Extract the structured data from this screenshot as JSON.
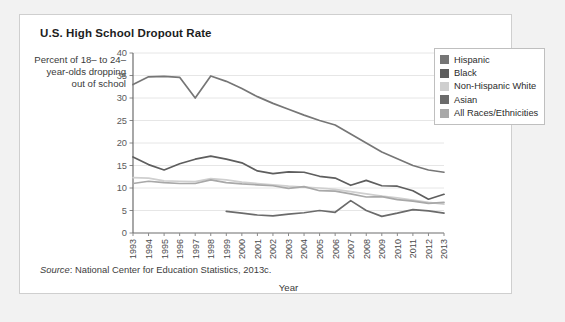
{
  "card": {
    "title": "U.S. High School Dropout Rate",
    "source_word": "Source",
    "source_rest": ": National Center for Education Statistics, 2013c."
  },
  "legend": {
    "position": "top-right",
    "items": [
      {
        "label": "Hispanic",
        "color": "#767676"
      },
      {
        "label": "Black",
        "color": "#5e5e5e"
      },
      {
        "label": "Non-Hispanic White",
        "color": "#cfcfcf"
      },
      {
        "label": "Asian",
        "color": "#6b6b6b"
      },
      {
        "label": "All Races/Ethnicities",
        "color": "#a8a8a8"
      }
    ]
  },
  "chart_data": {
    "type": "line",
    "title": "U.S. High School Dropout Rate",
    "xlabel": "Year",
    "ylabel": "Percent of 18– to 24–year-olds dropping out of school",
    "grid": true,
    "xlim": [
      1993,
      2013
    ],
    "ylim": [
      0,
      40
    ],
    "yticks": [
      0,
      5,
      10,
      15,
      20,
      25,
      30,
      35,
      40
    ],
    "ytick_labels": [
      "0",
      "5",
      "10",
      "15",
      "20",
      "25",
      "30",
      "35",
      "40"
    ],
    "x": [
      1993,
      1994,
      1995,
      1996,
      1997,
      1998,
      1999,
      2000,
      2001,
      2002,
      2003,
      2004,
      2005,
      2006,
      2007,
      2008,
      2009,
      2010,
      2011,
      2012,
      2013
    ],
    "categories": [
      "1993",
      "1994",
      "1995",
      "1996",
      "1997",
      "1998",
      "1999",
      "2000",
      "2001",
      "2002",
      "2003",
      "2004",
      "2005",
      "2006",
      "2007",
      "2008",
      "2009",
      "2010",
      "2011",
      "2012",
      "2013"
    ],
    "series": [
      {
        "name": "Hispanic",
        "color": "#767676",
        "values": [
          33.0,
          34.7,
          34.8,
          34.6,
          30.0,
          34.9,
          33.7,
          32.1,
          30.3,
          28.8,
          27.5,
          26.2,
          25.0,
          24.0,
          22.0,
          20.0,
          18.0,
          16.5,
          15.0,
          14.0,
          13.5
        ]
      },
      {
        "name": "Black",
        "color": "#5e5e5e",
        "values": [
          16.9,
          15.2,
          14.0,
          15.4,
          16.4,
          17.1,
          16.4,
          15.6,
          13.8,
          13.2,
          13.6,
          13.5,
          12.6,
          12.2,
          10.6,
          11.7,
          10.5,
          10.4,
          9.4,
          7.5,
          8.6
        ]
      },
      {
        "name": "Non-Hispanic White",
        "color": "#cfcfcf",
        "values": [
          12.3,
          12.2,
          11.6,
          11.5,
          11.4,
          12.1,
          11.8,
          11.3,
          11.0,
          10.7,
          10.4,
          10.2,
          10.0,
          9.7,
          9.2,
          8.7,
          8.2,
          7.8,
          7.3,
          6.8,
          6.4
        ]
      },
      {
        "name": "Asian",
        "color": "#6b6b6b",
        "values": [
          null,
          null,
          null,
          null,
          null,
          null,
          4.8,
          4.4,
          4.0,
          3.8,
          4.2,
          4.5,
          5.0,
          4.6,
          7.2,
          5.0,
          3.7,
          4.4,
          5.2,
          4.9,
          4.4
        ]
      },
      {
        "name": "All Races/Ethnicities",
        "color": "#a8a8a8",
        "values": [
          11.0,
          11.5,
          11.2,
          11.0,
          11.0,
          11.8,
          11.2,
          10.9,
          10.7,
          10.5,
          9.9,
          10.3,
          9.4,
          9.3,
          8.7,
          8.0,
          8.1,
          7.4,
          7.1,
          6.6,
          6.8
        ]
      }
    ]
  }
}
